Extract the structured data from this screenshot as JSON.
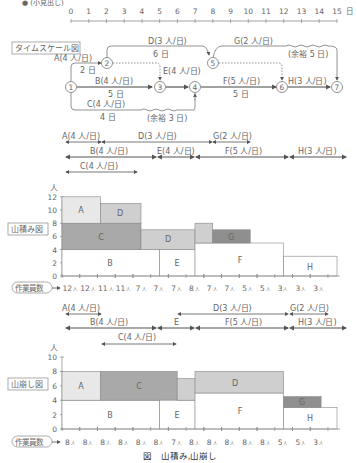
{
  "header": {
    "note": "● (小見出し)"
  },
  "axis": {
    "ticks": [
      "0",
      "1",
      "2",
      "3",
      "4",
      "5",
      "6",
      "7",
      "8",
      "9",
      "10",
      "11",
      "12",
      "13",
      "14",
      "15"
    ],
    "unit": "日"
  },
  "timescale": {
    "label": "タイムスケール図",
    "nodes": [
      "1",
      "2",
      "3",
      "4",
      "5",
      "6",
      "7"
    ],
    "activities": {
      "A": "A(4 人/日)",
      "A_days": "2 日",
      "B": "B(4 人/日)",
      "B_days": "5 日",
      "C": "C(4 人/日)",
      "C_days": "4 日",
      "C_float": "(余裕 3 日)",
      "D": "D(3 人/日)",
      "D_days": "6 日",
      "E": "E(4 人/日)",
      "F": "F(5 人/日)",
      "F_days": "5 日",
      "G": "G(2 人/日)",
      "G_float": "(余裕 5 日)",
      "H": "H(3 人/日)"
    }
  },
  "bars1": {
    "A": "A(4 人/日)",
    "B": "B(4 人/日)",
    "C": "C(4 人/日)",
    "D": "D(3 人/日)",
    "E": "E(4 人/日)",
    "F": "F(5 人/日)",
    "G": "G(2 人/日)",
    "H": "H(3 人/日)"
  },
  "bars2": {
    "A": "A(4 人/日)",
    "B": "B(4 人/日)",
    "C": "C(4 人/日)",
    "D": "D(3 人/日)",
    "E": "E",
    "F": "F(5 人/日)",
    "G": "G(2 人/日)",
    "H": "H(3 人/日)"
  },
  "chart1": {
    "label": "山積み図",
    "yunit": "人",
    "yticks": [
      "0",
      "2",
      "4",
      "6",
      "8",
      "10",
      "12"
    ]
  },
  "chart2": {
    "label": "山崩し図",
    "yunit": "人",
    "yticks": [
      "0",
      "2",
      "4",
      "6",
      "8",
      "10"
    ]
  },
  "workers_label": "作業員数",
  "workers1": [
    "12",
    "12",
    "11",
    "11",
    "7",
    "7",
    "7",
    "8",
    "7",
    "7",
    "5",
    "5",
    "3",
    "3",
    "3"
  ],
  "workers2": [
    "8",
    "8",
    "8",
    "8",
    "8",
    "8",
    "7",
    "8",
    "8",
    "8",
    "8",
    "8",
    "5",
    "5",
    "3"
  ],
  "worker_unit": "人",
  "caption": "図　山積み,山崩し",
  "colors": {
    "light": "#e8e8e8",
    "mid": "#cfcfcf",
    "dark": "#a9a9a9",
    "darker": "#8f8f8f",
    "line": "#777777"
  },
  "chart_data": [
    {
      "type": "area",
      "title": "山積み図",
      "xlabel": "日",
      "ylabel": "人",
      "ylim": [
        0,
        12
      ],
      "x": [
        1,
        2,
        3,
        4,
        5,
        6,
        7,
        8,
        9,
        10,
        11,
        12,
        13,
        14,
        15
      ],
      "series": [
        {
          "name": "作業員数",
          "values": [
            12,
            12,
            11,
            11,
            7,
            7,
            7,
            8,
            7,
            7,
            5,
            5,
            3,
            3,
            3
          ]
        }
      ]
    },
    {
      "type": "area",
      "title": "山崩し図",
      "xlabel": "日",
      "ylabel": "人",
      "ylim": [
        0,
        10
      ],
      "x": [
        1,
        2,
        3,
        4,
        5,
        6,
        7,
        8,
        9,
        10,
        11,
        12,
        13,
        14,
        15
      ],
      "series": [
        {
          "name": "作業員数",
          "values": [
            8,
            8,
            8,
            8,
            8,
            8,
            7,
            8,
            8,
            8,
            8,
            8,
            5,
            5,
            3
          ]
        }
      ]
    }
  ]
}
